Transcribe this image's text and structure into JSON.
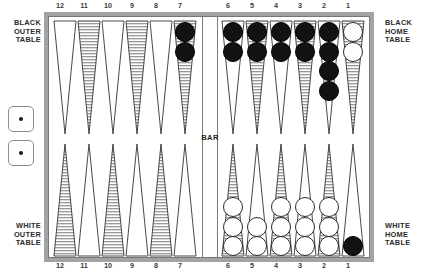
{
  "board": {
    "title": "Backgammon Board",
    "bar_label": "BAR",
    "labels": {
      "black_outer": "BLACK\nOUTER\nTABLE",
      "black_home": "BLACK\nHOME\nTABLE",
      "white_outer": "WHITE\nOUTER\nTABLE",
      "white_home": "WHITE\nHOME\nTABLE"
    },
    "colors": {
      "frame": "#a3a3a3",
      "point_shaded": "#9a9a9a",
      "point_outline": "#333333",
      "black_checker": "#121212",
      "white_checker": "#ffffff",
      "background": "#ffffff",
      "text": "#2b2b2b"
    },
    "point_numbers": {
      "top_left": [
        "12",
        "11",
        "10",
        "9",
        "8",
        "7"
      ],
      "top_right": [
        "6",
        "5",
        "4",
        "3",
        "2",
        "1"
      ],
      "bottom_left": [
        "12",
        "11",
        "10",
        "9",
        "8",
        "7"
      ],
      "bottom_right": [
        "6",
        "5",
        "4",
        "3",
        "2",
        "1"
      ]
    }
  },
  "dice": [
    {
      "name": "die-upper",
      "value": 1,
      "pips": 1
    },
    {
      "name": "die-lower",
      "value": 1,
      "pips": 1
    }
  ],
  "quadrants": {
    "black_outer_table": {
      "name": "black-outer-table",
      "position": "top-left",
      "points": [
        {
          "number": "12",
          "shaded": false,
          "checkers": {
            "color": "none",
            "count": 0
          }
        },
        {
          "number": "11",
          "shaded": true,
          "checkers": {
            "color": "none",
            "count": 0
          }
        },
        {
          "number": "10",
          "shaded": false,
          "checkers": {
            "color": "none",
            "count": 0
          }
        },
        {
          "number": "9",
          "shaded": true,
          "checkers": {
            "color": "none",
            "count": 0
          }
        },
        {
          "number": "8",
          "shaded": false,
          "checkers": {
            "color": "none",
            "count": 0
          }
        },
        {
          "number": "7",
          "shaded": true,
          "checkers": {
            "color": "black",
            "count": 2
          }
        }
      ]
    },
    "black_home_table": {
      "name": "black-home-table",
      "position": "top-right",
      "points": [
        {
          "number": "6",
          "shaded": false,
          "checkers": {
            "color": "black",
            "count": 2
          }
        },
        {
          "number": "5",
          "shaded": true,
          "checkers": {
            "color": "black",
            "count": 2
          }
        },
        {
          "number": "4",
          "shaded": false,
          "checkers": {
            "color": "black",
            "count": 2
          }
        },
        {
          "number": "3",
          "shaded": true,
          "checkers": {
            "color": "black",
            "count": 2
          }
        },
        {
          "number": "2",
          "shaded": false,
          "checkers": {
            "color": "black",
            "count": 4
          }
        },
        {
          "number": "1",
          "shaded": true,
          "checkers": {
            "color": "white",
            "count": 2
          }
        }
      ]
    },
    "white_outer_table": {
      "name": "white-outer-table",
      "position": "bottom-left",
      "points": [
        {
          "number": "12",
          "shaded": true,
          "checkers": {
            "color": "none",
            "count": 0
          }
        },
        {
          "number": "11",
          "shaded": false,
          "checkers": {
            "color": "none",
            "count": 0
          }
        },
        {
          "number": "10",
          "shaded": true,
          "checkers": {
            "color": "none",
            "count": 0
          }
        },
        {
          "number": "9",
          "shaded": false,
          "checkers": {
            "color": "none",
            "count": 0
          }
        },
        {
          "number": "8",
          "shaded": true,
          "checkers": {
            "color": "none",
            "count": 0
          }
        },
        {
          "number": "7",
          "shaded": false,
          "checkers": {
            "color": "none",
            "count": 0
          }
        }
      ]
    },
    "white_home_table": {
      "name": "white-home-table",
      "position": "bottom-right",
      "points": [
        {
          "number": "6",
          "shaded": true,
          "checkers": {
            "color": "white",
            "count": 3
          }
        },
        {
          "number": "5",
          "shaded": false,
          "checkers": {
            "color": "white",
            "count": 2
          }
        },
        {
          "number": "4",
          "shaded": true,
          "checkers": {
            "color": "white",
            "count": 3
          }
        },
        {
          "number": "3",
          "shaded": false,
          "checkers": {
            "color": "white",
            "count": 3
          }
        },
        {
          "number": "2",
          "shaded": true,
          "checkers": {
            "color": "white",
            "count": 3
          }
        },
        {
          "number": "1",
          "shaded": false,
          "checkers": {
            "color": "black",
            "count": 1
          }
        }
      ]
    }
  }
}
